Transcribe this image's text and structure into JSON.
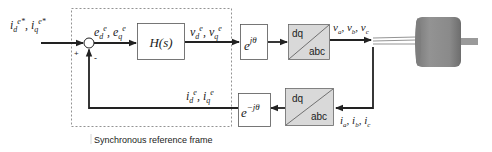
{
  "diagram": {
    "input_reference": {
      "d": "i",
      "d_sub": "d",
      "d_sup": "e*",
      "q": "i",
      "q_sub": "q",
      "q_sup": "e*"
    },
    "error_signal": {
      "d": "e",
      "d_sub": "d",
      "d_sup": "e",
      "q": "e",
      "q_sub": "q",
      "q_sup": "e"
    },
    "voltage_command": {
      "d": "v",
      "d_sub": "d",
      "d_sup": "e",
      "q": "v",
      "q_sub": "q",
      "q_sup": "e"
    },
    "feedback_current": {
      "d": "i",
      "d_sub": "d",
      "d_sup": "e",
      "q": "i",
      "q_sub": "q",
      "q_sup": "e"
    },
    "phase_voltages": {
      "a": "v",
      "a_sub": "a",
      "b": "v",
      "b_sub": "b",
      "c": "v",
      "c_sub": "c"
    },
    "phase_currents": {
      "a": "i",
      "a_sub": "a",
      "b": "i",
      "b_sub": "b",
      "c": "i",
      "c_sub": "c"
    },
    "summing_junction": {
      "plus": "+",
      "minus": "-"
    },
    "blocks": {
      "controller": {
        "label": "H(s)"
      },
      "forward_rotation": {
        "base": "e",
        "exponent": "jθ"
      },
      "inverse_rotation": {
        "base": "e",
        "exponent": "−jθ"
      },
      "forward_transform": {
        "top": "dq",
        "bottom": "abc"
      },
      "inverse_transform": {
        "top": "dq",
        "bottom": "abc"
      }
    },
    "frame_label": "Synchronous reference frame",
    "colors": {
      "line": "#222222",
      "block_fill_gray": "#d9d9d9",
      "motor_body": "#8a8a8a",
      "motor_shaft": "#9a9a9a",
      "dashed": "#777777"
    }
  }
}
